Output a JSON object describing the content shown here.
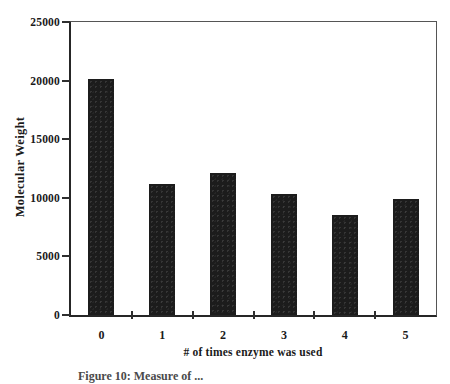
{
  "figure": {
    "caption_partial": "Figure 10:  Measure of ..."
  },
  "chart_data": {
    "type": "bar",
    "title": "",
    "categories": [
      "0",
      "1",
      "2",
      "3",
      "4",
      "5"
    ],
    "values": [
      20100,
      11200,
      12100,
      10300,
      8500,
      9900
    ],
    "xlabel": "# of times enzyme was used",
    "ylabel": "Molecular Weight",
    "ylim": [
      0,
      25000
    ],
    "yticks": [
      0,
      5000,
      10000,
      15000,
      20000,
      25000
    ],
    "grid": false,
    "legend_position": "none",
    "bar_color": "#1c1c1c",
    "axis_color": "#2e2e2e",
    "text_color": "#1a1a1a"
  }
}
